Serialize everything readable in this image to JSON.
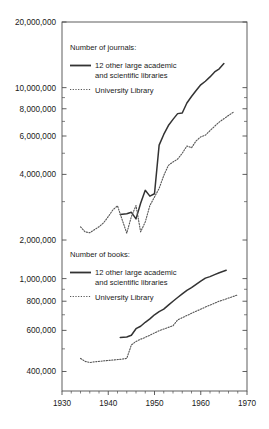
{
  "chart_data": {
    "type": "line",
    "title": "",
    "xlabel": "",
    "ylabel": "",
    "xlim": [
      1930,
      1970
    ],
    "xticks": [
      1930,
      1940,
      1950,
      1960,
      1970
    ],
    "xticklabels": [
      "1930",
      "1940",
      "1950",
      "1960",
      "1970"
    ],
    "grid": false,
    "yscale": "log",
    "panels": [
      {
        "name": "journals",
        "legend_title": "Number of journals:",
        "ylim": [
          1800000,
          20000000
        ],
        "yticks": [
          2000000,
          4000000,
          6000000,
          8000000,
          10000000,
          20000000
        ],
        "yticklabels": [
          "2,000,000",
          "4,000,000",
          "6,000,000",
          "8,000,000",
          "10,000,000",
          "20,000,000"
        ],
        "series": [
          {
            "name": "12 other large academic and scientific libraries",
            "style": "solid",
            "color": "#333333",
            "points": [
              [
                1942.6,
                2620000
              ],
              [
                1944.0,
                2640000
              ],
              [
                1945.0,
                2680000
              ],
              [
                1946.0,
                2500000
              ],
              [
                1947.0,
                2950000
              ],
              [
                1948.0,
                3380000
              ],
              [
                1949.0,
                3180000
              ],
              [
                1950.0,
                3260000
              ],
              [
                1951.0,
                5450000
              ],
              [
                1952.0,
                6100000
              ],
              [
                1953.0,
                6700000
              ],
              [
                1954.0,
                7150000
              ],
              [
                1955.0,
                7600000
              ],
              [
                1956.0,
                7650000
              ],
              [
                1957.0,
                8500000
              ],
              [
                1958.0,
                9100000
              ],
              [
                1959.0,
                9700000
              ],
              [
                1960.0,
                10300000
              ],
              [
                1961.0,
                10700000
              ],
              [
                1962.0,
                11200000
              ],
              [
                1963.0,
                11800000
              ],
              [
                1964.0,
                12200000
              ],
              [
                1965.0,
                12900000
              ]
            ]
          },
          {
            "name": "University Library",
            "style": "dotted",
            "color": "#555555",
            "points": [
              [
                1934.0,
                2300000
              ],
              [
                1935.0,
                2180000
              ],
              [
                1936.0,
                2160000
              ],
              [
                1937.0,
                2230000
              ],
              [
                1938.0,
                2300000
              ],
              [
                1939.0,
                2400000
              ],
              [
                1940.0,
                2560000
              ],
              [
                1941.0,
                2750000
              ],
              [
                1942.0,
                2870000
              ],
              [
                1943.0,
                2480000
              ],
              [
                1944.0,
                2150000
              ],
              [
                1945.0,
                2560000
              ],
              [
                1946.0,
                2880000
              ],
              [
                1947.0,
                2180000
              ],
              [
                1948.0,
                2420000
              ],
              [
                1949.0,
                2880000
              ],
              [
                1950.0,
                3150000
              ],
              [
                1951.0,
                3450000
              ],
              [
                1952.0,
                3950000
              ],
              [
                1953.0,
                4400000
              ],
              [
                1954.0,
                4560000
              ],
              [
                1955.0,
                4700000
              ],
              [
                1956.0,
                5000000
              ],
              [
                1957.0,
                5400000
              ],
              [
                1958.0,
                5300000
              ],
              [
                1959.0,
                5700000
              ],
              [
                1960.0,
                5950000
              ],
              [
                1961.0,
                6050000
              ],
              [
                1962.0,
                6350000
              ],
              [
                1963.0,
                6650000
              ],
              [
                1964.0,
                6950000
              ],
              [
                1965.0,
                7200000
              ],
              [
                1966.0,
                7450000
              ],
              [
                1967.0,
                7700000
              ]
            ]
          }
        ]
      },
      {
        "name": "books",
        "legend_title": "Number of books:",
        "ylim": [
          330000,
          1300000
        ],
        "yticks": [
          400000,
          600000,
          800000,
          1000000
        ],
        "yticklabels": [
          "400,000",
          "600,000",
          "800,000",
          "1,000,000"
        ],
        "series": [
          {
            "name": "12 other large academic and scientific libraries",
            "style": "solid",
            "color": "#333333",
            "points": [
              [
                1942.6,
                560000
              ],
              [
                1944.0,
                562000
              ],
              [
                1945.0,
                572000
              ],
              [
                1946.0,
                610000
              ],
              [
                1947.0,
                625000
              ],
              [
                1948.0,
                650000
              ],
              [
                1949.0,
                672000
              ],
              [
                1950.0,
                700000
              ],
              [
                1951.0,
                722000
              ],
              [
                1952.0,
                740000
              ],
              [
                1953.0,
                770000
              ],
              [
                1954.0,
                800000
              ],
              [
                1955.0,
                830000
              ],
              [
                1956.0,
                860000
              ],
              [
                1957.0,
                890000
              ],
              [
                1958.0,
                915000
              ],
              [
                1959.0,
                945000
              ],
              [
                1960.0,
                975000
              ],
              [
                1961.0,
                1005000
              ],
              [
                1962.0,
                1020000
              ],
              [
                1963.0,
                1040000
              ],
              [
                1964.0,
                1060000
              ],
              [
                1965.5,
                1085000
              ]
            ]
          },
          {
            "name": "University Library",
            "style": "dotted",
            "color": "#555555",
            "points": [
              [
                1934.0,
                455000
              ],
              [
                1935.0,
                442000
              ],
              [
                1936.0,
                437000
              ],
              [
                1937.0,
                440000
              ],
              [
                1938.0,
                442000
              ],
              [
                1939.0,
                444000
              ],
              [
                1940.0,
                446000
              ],
              [
                1941.0,
                448000
              ],
              [
                1942.0,
                450000
              ],
              [
                1943.0,
                452000
              ],
              [
                1944.0,
                455000
              ],
              [
                1945.0,
                520000
              ],
              [
                1946.0,
                538000
              ],
              [
                1947.0,
                550000
              ],
              [
                1948.0,
                560000
              ],
              [
                1949.0,
                572000
              ],
              [
                1950.0,
                585000
              ],
              [
                1951.0,
                598000
              ],
              [
                1952.0,
                608000
              ],
              [
                1953.0,
                618000
              ],
              [
                1954.0,
                628000
              ],
              [
                1955.0,
                665000
              ],
              [
                1956.0,
                680000
              ],
              [
                1957.0,
                695000
              ],
              [
                1958.0,
                710000
              ],
              [
                1959.0,
                725000
              ],
              [
                1960.0,
                740000
              ],
              [
                1961.0,
                755000
              ],
              [
                1962.0,
                770000
              ],
              [
                1963.0,
                785000
              ],
              [
                1964.0,
                800000
              ],
              [
                1965.0,
                812000
              ],
              [
                1966.0,
                825000
              ],
              [
                1967.0,
                838000
              ],
              [
                1968.0,
                852000
              ]
            ]
          }
        ]
      }
    ]
  },
  "legends": {
    "journals": {
      "title": "Number of journals:",
      "entry_solid_line1": "12 other large academic",
      "entry_solid_line2": "and scientific libraries",
      "entry_dotted": "University Library"
    },
    "books": {
      "title": "Number of books:",
      "entry_solid_line1": "12 other large academic",
      "entry_solid_line2": "and scientific libraries",
      "entry_dotted": "University Library"
    }
  },
  "colors": {
    "axis": "#4d4d4d",
    "solid_series": "#333333",
    "dotted_series": "#555555",
    "text": "#1a1a1a",
    "background": "#ffffff"
  }
}
